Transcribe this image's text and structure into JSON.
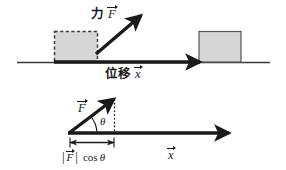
{
  "figure": {
    "background_color": "#ffffff",
    "line_color": "#1a1a1a",
    "box_fill_color": "#d4d4d4",
    "box_stroke_color": "#4d4d4d",
    "width": 286,
    "height": 170
  },
  "top_diagram": {
    "force_label": {
      "word": "力",
      "symbol": "F",
      "full": "力 F⃗"
    },
    "displacement_label": {
      "word": "位移",
      "symbol": "x",
      "full": "位移 x⃗"
    },
    "initial_box": {
      "name": "initial-position-box",
      "border_style": "dashed"
    },
    "final_box": {
      "name": "final-position-box",
      "border_style": "solid"
    }
  },
  "bottom_diagram": {
    "force_vector_label": "F",
    "angle_label": "θ",
    "displacement_vector_label": "x",
    "projection_label": {
      "magnitude_open": "|",
      "symbol": "F",
      "magnitude_close": "|",
      "trig": "cos",
      "angle": "θ",
      "full": "|F⃗| cos θ"
    }
  }
}
